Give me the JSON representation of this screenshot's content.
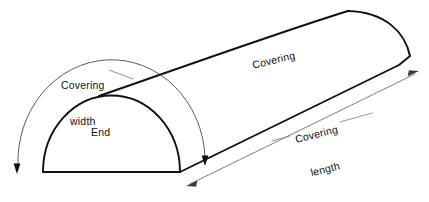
{
  "figure": {
    "type": "technical-line-diagram",
    "background_color": "#ffffff",
    "line_color": "#111111",
    "thin_line_color": "#6f6f6f"
  },
  "labels": {
    "covering_width_line1": "Covering",
    "covering_width_line2": "width",
    "end": "End",
    "covering": "Covering",
    "covering_length_line1": "Covering",
    "covering_length_line2": "length"
  },
  "annotations": {
    "width_dimension": {
      "label": "Covering width",
      "style": "curved arc with arrowheads at both ends",
      "arrow_start": "down-left arrowhead",
      "arrow_end": "down arrowhead"
    },
    "length_dimension": {
      "label": "Covering length",
      "style": "straight double-headed dimension line",
      "arrow_start": "lower-left arrowhead",
      "arrow_end": "upper-right arrowhead"
    },
    "end_face": {
      "label": "End",
      "style": "semicircular face"
    },
    "body_surface": {
      "label": "Covering",
      "style": "curved top surface of the tunnel"
    }
  }
}
